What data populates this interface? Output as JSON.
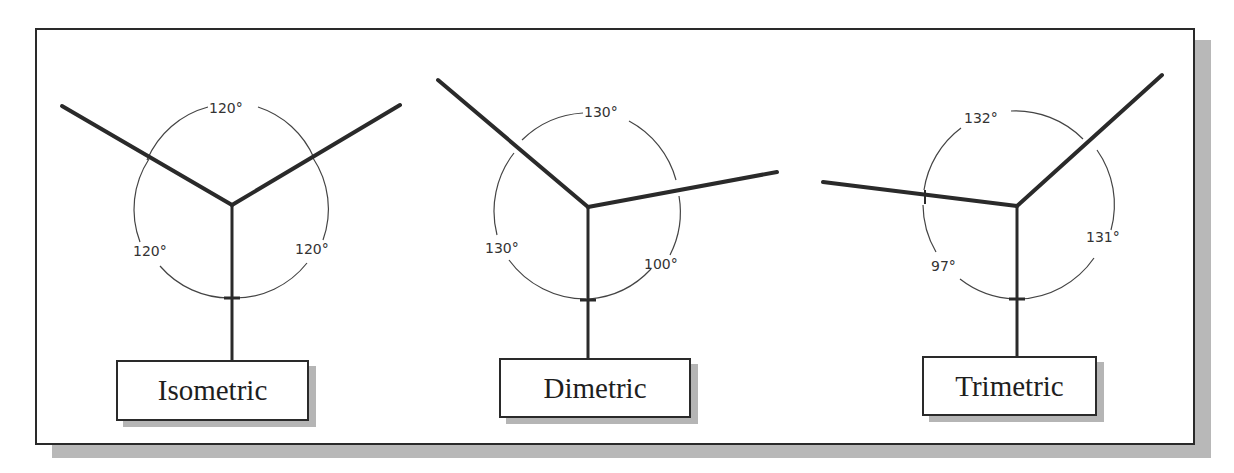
{
  "diagram": {
    "type": "axonometric-projection-comparison",
    "projections": [
      {
        "name": "Isometric",
        "angles": {
          "top": "120°",
          "left": "120°",
          "right": "120°"
        }
      },
      {
        "name": "Dimetric",
        "angles": {
          "top": "130°",
          "left": "130°",
          "right": "100°"
        }
      },
      {
        "name": "Trimetric",
        "angles": {
          "top": "132°",
          "left": "97°",
          "right": "131°"
        }
      }
    ],
    "colors": {
      "line": "#2a2a2a",
      "shadow": "#b8b8b8",
      "background": "#ffffff"
    }
  }
}
